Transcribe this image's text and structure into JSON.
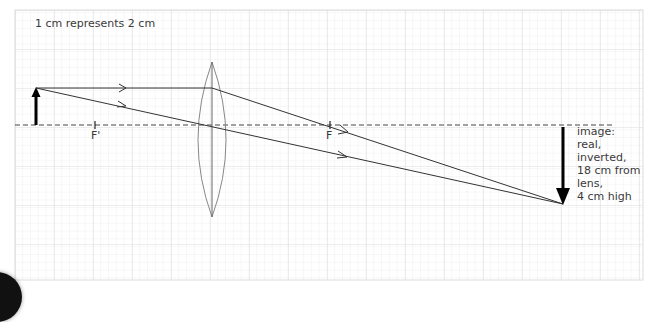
{
  "diagram": {
    "scale_label": "1 cm represents 2 cm",
    "focal_labels": {
      "near": "F'",
      "far": "F"
    },
    "image_description": {
      "lines": [
        "image:",
        "real,",
        "inverted,",
        "18 cm from",
        "lens,",
        "4 cm high"
      ]
    },
    "colors": {
      "grid_minor": "#ececec",
      "grid_major": "#dcdcdc",
      "rays": "#333333",
      "lens": "#888888",
      "axis": "#444444",
      "object_arrow": "#000000",
      "text": "#3a3a3a"
    },
    "elements": {
      "object": "upright arrow, left of lens",
      "lens": "biconvex converging lens",
      "image": "inverted arrow, right of F"
    }
  }
}
